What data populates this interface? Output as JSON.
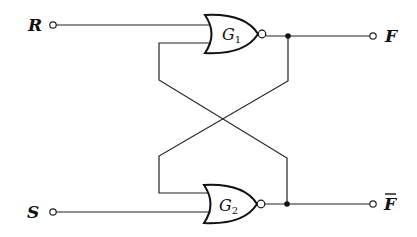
{
  "diagram": {
    "type": "SR latch (cross-coupled NOR gates)",
    "inputs": [
      {
        "name": "R",
        "label": "R"
      },
      {
        "name": "S",
        "label": "S"
      }
    ],
    "outputs": [
      {
        "name": "F",
        "label": "F"
      },
      {
        "name": "F_bar",
        "label": "F"
      }
    ],
    "gates": [
      {
        "id": "G1",
        "letter": "G",
        "subscript": "1",
        "type": "NOR"
      },
      {
        "id": "G2",
        "letter": "G",
        "subscript": "2",
        "type": "NOR"
      }
    ],
    "connections": [
      "R -> G1 input 1",
      "G1 output -> F",
      "G1 output -> G2 input 1 (cross feedback)",
      "S -> G2 input 2",
      "G2 output -> F_bar",
      "G2 output -> G1 input 2 (cross feedback)"
    ],
    "colors": {
      "line": "#111111",
      "background": "#ffffff"
    }
  }
}
